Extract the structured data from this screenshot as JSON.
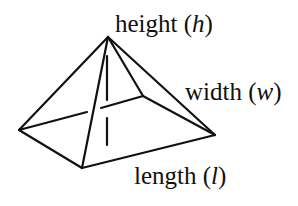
{
  "diagram": {
    "type": "square pyramid",
    "labels": {
      "height": {
        "word": "height",
        "open": " (",
        "var": "h",
        "close": ")"
      },
      "width": {
        "word": "width",
        "open": " (",
        "var": "w",
        "close": ")"
      },
      "length": {
        "word": "length",
        "open": " (",
        "var": "l",
        "close": ")"
      }
    },
    "vertices": {
      "apex": [
        108,
        37
      ],
      "left": [
        19,
        130
      ],
      "front": [
        82,
        168
      ],
      "right": [
        215,
        135
      ],
      "back": [
        143,
        96
      ]
    },
    "colors": {
      "stroke": "#111111",
      "background": "#ffffff"
    }
  }
}
